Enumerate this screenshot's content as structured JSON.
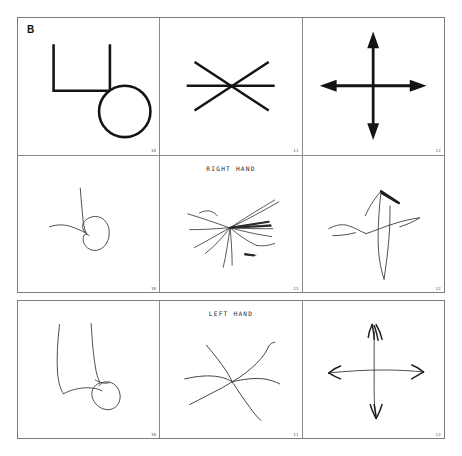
{
  "panel": {
    "letter": "B"
  },
  "blocks": [
    {
      "id": "model-and-right-hand",
      "rows": [
        {
          "id": "model-row",
          "row_label": "",
          "cells": [
            {
              "number": "10",
              "figure": "bracket-circle-model"
            },
            {
              "number": "11",
              "figure": "six-point-asterisk-model"
            },
            {
              "number": "12",
              "figure": "four-headed-arrow-cross-model"
            }
          ]
        },
        {
          "id": "right-hand-row",
          "row_label": "RIGHT HAND",
          "cells": [
            {
              "number": "10",
              "figure": "bracket-circle-drawing-right"
            },
            {
              "number": "11",
              "figure": "asterisk-drawing-right"
            },
            {
              "number": "12",
              "figure": "cross-drawing-right"
            }
          ]
        }
      ]
    },
    {
      "id": "left-hand",
      "rows": [
        {
          "id": "left-hand-row",
          "row_label": "LEFT HAND",
          "cells": [
            {
              "number": "10",
              "figure": "bracket-circle-drawing-left"
            },
            {
              "number": "11",
              "figure": "asterisk-drawing-left"
            },
            {
              "number": "12",
              "figure": "cross-drawing-left"
            }
          ]
        }
      ]
    }
  ],
  "colors": {
    "model_stroke": "#141414",
    "drawing_stroke": "#3a3a3a",
    "border": "#7d7d7d",
    "inner_border": "#8a8a8a",
    "background": "#ffffff",
    "number_text": "#5a5a5a",
    "label_text": "#2b2b2b"
  }
}
